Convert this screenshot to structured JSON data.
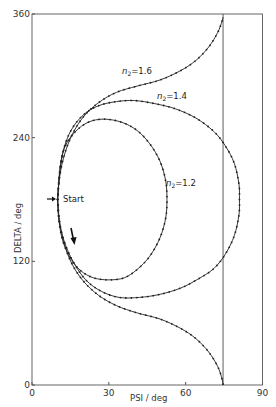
{
  "chart_data": {
    "type": "line",
    "title": "",
    "xlabel": "PSI / deg",
    "ylabel": "DELTA / deg",
    "xlim": [
      0,
      90
    ],
    "ylim": [
      0,
      360
    ],
    "xticks": [
      0,
      30,
      60,
      90
    ],
    "yticks": [
      0,
      120,
      240,
      360
    ],
    "xtick_labels": [
      "0",
      "30",
      "60",
      "90"
    ],
    "ytick_labels": [
      "0",
      "120",
      "240",
      "360"
    ],
    "grid": false,
    "legend": "none",
    "vertical_reference_line": {
      "psi": 74.6
    },
    "start_point": {
      "psi": 10,
      "delta": 180,
      "label": "Start"
    },
    "series": [
      {
        "name": "n2=1.2",
        "label_main": "n",
        "label_sub": "2",
        "label_value": "=1.2",
        "points": [
          [
            10,
            180
          ],
          [
            10.5,
            160
          ],
          [
            12,
            140
          ],
          [
            15,
            123
          ],
          [
            19,
            111
          ],
          [
            24,
            104
          ],
          [
            30,
            102
          ],
          [
            36,
            104
          ],
          [
            41,
            112
          ],
          [
            46,
            125
          ],
          [
            50,
            143
          ],
          [
            52.2,
            162
          ],
          [
            52.7,
            180
          ],
          [
            52.2,
            198
          ],
          [
            50,
            217
          ],
          [
            46,
            234
          ],
          [
            41,
            247
          ],
          [
            35,
            255
          ],
          [
            28,
            258
          ],
          [
            22,
            255
          ],
          [
            17,
            246
          ],
          [
            13,
            232
          ],
          [
            11,
            212
          ],
          [
            10,
            180
          ]
        ]
      },
      {
        "name": "n2=1.4",
        "label_main": "n",
        "label_sub": "2",
        "label_value": "=1.4",
        "points": [
          [
            10,
            180
          ],
          [
            10.6,
            160
          ],
          [
            12.5,
            140
          ],
          [
            16,
            120
          ],
          [
            21,
            102
          ],
          [
            27,
            91
          ],
          [
            34,
            85
          ],
          [
            42,
            85
          ],
          [
            50,
            88
          ],
          [
            58,
            94
          ],
          [
            65,
            103
          ],
          [
            71,
            113
          ],
          [
            75.5,
            127
          ],
          [
            79,
            145
          ],
          [
            80.8,
            165
          ],
          [
            81,
            180
          ],
          [
            80.8,
            195
          ],
          [
            79,
            215
          ],
          [
            75.5,
            232
          ],
          [
            71,
            246
          ],
          [
            64,
            259
          ],
          [
            56,
            268
          ],
          [
            48,
            273
          ],
          [
            40,
            276
          ],
          [
            33,
            275
          ],
          [
            26,
            271
          ],
          [
            20,
            262
          ],
          [
            15,
            246
          ],
          [
            12,
            225
          ],
          [
            10.6,
            200
          ],
          [
            10,
            180
          ]
        ]
      },
      {
        "name": "n2=1.6",
        "label_main": "n",
        "label_sub": "2",
        "label_value": "=1.6",
        "points_lower": [
          [
            10,
            180
          ],
          [
            10.8,
            158
          ],
          [
            12.5,
            138
          ],
          [
            15.5,
            118
          ],
          [
            20,
            101
          ],
          [
            26,
            87
          ],
          [
            33,
            77
          ],
          [
            41,
            70
          ],
          [
            50,
            64
          ],
          [
            58,
            55
          ],
          [
            64,
            45
          ],
          [
            69,
            32
          ],
          [
            72.5,
            18
          ],
          [
            74.2,
            6
          ],
          [
            74.6,
            0
          ]
        ],
        "points_upper": [
          [
            10,
            180
          ],
          [
            10.8,
            202
          ],
          [
            12.5,
            222
          ],
          [
            15.5,
            242
          ],
          [
            20,
            260
          ],
          [
            26,
            274
          ],
          [
            33,
            284
          ],
          [
            41,
            290
          ],
          [
            50,
            296
          ],
          [
            58,
            305
          ],
          [
            64,
            315
          ],
          [
            69,
            328
          ],
          [
            72.5,
            342
          ],
          [
            74.2,
            353
          ],
          [
            74.6,
            357
          ]
        ]
      }
    ],
    "annotations": [
      {
        "text": "Start",
        "psi": 12.5,
        "delta": 180
      }
    ]
  }
}
